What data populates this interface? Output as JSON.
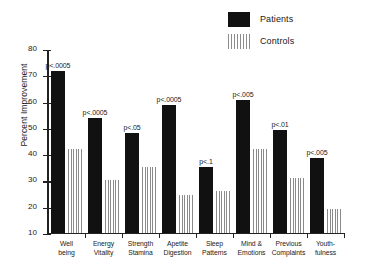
{
  "chart_data": {
    "type": "bar",
    "title": "",
    "xlabel": "",
    "ylabel": "Percent Improvement",
    "ylim": [
      10,
      80
    ],
    "yticks": [
      10,
      20,
      30,
      40,
      50,
      60,
      70,
      80
    ],
    "grid": false,
    "legend_position": "top-right",
    "categories": [
      "Well being",
      "Energy Vitality",
      "Strength Stamina",
      "Apetite Digestion",
      "Sleep Patterns",
      "Mind & Emotions",
      "Previous Complaints",
      "Youth-fulness"
    ],
    "category_lines": [
      [
        "Well",
        "being"
      ],
      [
        "Energy",
        "Vitality"
      ],
      [
        "Strength",
        "Stamina"
      ],
      [
        "Apetite",
        "Digestion"
      ],
      [
        "Sleep",
        "Patterns"
      ],
      [
        "Mind &",
        "Emotions"
      ],
      [
        "Previous",
        "Complaints"
      ],
      [
        "Youth-",
        "fulness"
      ]
    ],
    "series": [
      {
        "name": "Patients",
        "values": [
          72,
          54,
          48,
          59,
          35,
          61,
          49.5,
          38.5
        ]
      },
      {
        "name": "Controls",
        "values": [
          42,
          30,
          35,
          24.5,
          26,
          42,
          31,
          19
        ]
      }
    ],
    "annotations": [
      "p<.0005",
      "p<.0005",
      "p<.05",
      "p<.0005",
      "p<.1",
      "p<.005",
      "p<.01",
      "p<.005"
    ]
  },
  "legend": {
    "items": [
      {
        "label": "Patients",
        "swatch": "solid-black-square"
      },
      {
        "label": "Controls",
        "swatch": "vertical-striped-square"
      }
    ]
  },
  "colors": {
    "patients": "#111111",
    "controls": "#8a8a8a",
    "axis": "#222222",
    "text": "#1a1a1a",
    "background": "#ffffff"
  }
}
